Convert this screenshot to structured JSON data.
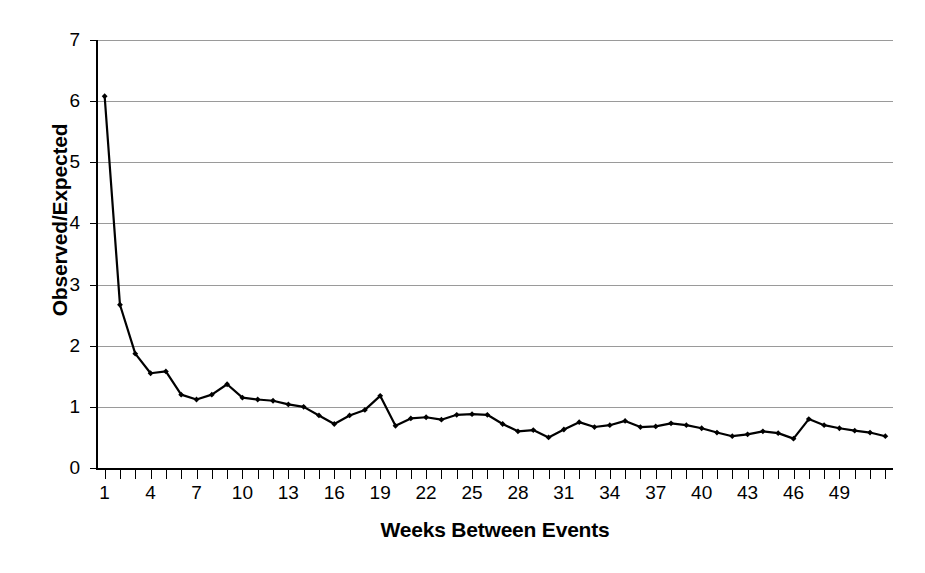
{
  "chart_data": {
    "type": "line",
    "title": "",
    "xlabel": "Weeks Between Events",
    "ylabel": "Observed/Expected",
    "xlim": [
      0.5,
      52.5
    ],
    "ylim": [
      0,
      7
    ],
    "grid": true,
    "legend": false,
    "marker": "diamond",
    "line_color": "#000000",
    "grid_color": "#9a9a9a",
    "ytick_labels": [
      "0",
      "1",
      "2",
      "3",
      "4",
      "5",
      "6",
      "7"
    ],
    "ytick_values": [
      0,
      1,
      2,
      3,
      4,
      5,
      6,
      7
    ],
    "xtick_labels": [
      "1",
      "4",
      "7",
      "10",
      "13",
      "16",
      "19",
      "22",
      "25",
      "28",
      "31",
      "34",
      "37",
      "40",
      "43",
      "46",
      "49"
    ],
    "xtick_values": [
      1,
      4,
      7,
      10,
      13,
      16,
      19,
      22,
      25,
      28,
      31,
      34,
      37,
      40,
      43,
      46,
      49
    ],
    "x": [
      1,
      2,
      3,
      4,
      5,
      6,
      7,
      8,
      9,
      10,
      11,
      12,
      13,
      14,
      15,
      16,
      17,
      18,
      19,
      20,
      21,
      22,
      23,
      24,
      25,
      26,
      27,
      28,
      29,
      30,
      31,
      32,
      33,
      34,
      35,
      36,
      37,
      38,
      39,
      40,
      41,
      42,
      43,
      44,
      45,
      46,
      47,
      48,
      49,
      50,
      51,
      52
    ],
    "values": [
      6.08,
      2.67,
      1.87,
      1.55,
      1.58,
      1.2,
      1.12,
      1.2,
      1.37,
      1.15,
      1.12,
      1.1,
      1.04,
      1.0,
      0.86,
      0.72,
      0.86,
      0.95,
      1.18,
      0.69,
      0.81,
      0.83,
      0.79,
      0.87,
      0.88,
      0.87,
      0.72,
      0.6,
      0.62,
      0.5,
      0.63,
      0.75,
      0.67,
      0.7,
      0.77,
      0.67,
      0.68,
      0.73,
      0.7,
      0.65,
      0.58,
      0.52,
      0.55,
      0.6,
      0.57,
      0.48,
      0.8,
      0.7,
      0.65,
      0.61,
      0.58,
      0.52
    ],
    "series_name": "Observed/Expected ratio"
  }
}
